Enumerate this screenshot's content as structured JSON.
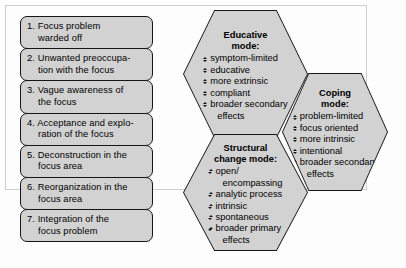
{
  "diagram": {
    "stages": {
      "title": "Stages of focus processing",
      "items": [
        {
          "num": "1.",
          "line1": "Focus problem",
          "line2": "warded off"
        },
        {
          "num": "2.",
          "line1": "Unwanted preoccupa-",
          "line2": "tion with the focus"
        },
        {
          "num": "3.",
          "line1": "Vague awareness of",
          "line2": "the focus"
        },
        {
          "num": "4.",
          "line1": "Acceptance and explo-",
          "line2": "ration of the focus"
        },
        {
          "num": "5.",
          "line1": "Deconstruction in the",
          "line2": "focus area"
        },
        {
          "num": "6.",
          "line1": "Reorganization in the",
          "line2": "focus area"
        },
        {
          "num": "7.",
          "line1": "Integration of the",
          "line2": "focus problem"
        }
      ]
    },
    "modes": [
      {
        "id": "educative",
        "title": "Educative\nmode:",
        "items": [
          {
            "text": "symptom-limited",
            "cont": ""
          },
          {
            "text": "educative",
            "cont": ""
          },
          {
            "text": "more extrinsic",
            "cont": ""
          },
          {
            "text": "compliant",
            "cont": ""
          },
          {
            "text": "broader secondary",
            "cont": "effects"
          }
        ]
      },
      {
        "id": "coping",
        "title": "Coping\nmode:",
        "items": [
          {
            "text": "problem-limited",
            "cont": ""
          },
          {
            "text": "focus oriented",
            "cont": ""
          },
          {
            "text": "more intrinsic",
            "cont": ""
          },
          {
            "text": "intentional",
            "cont": ""
          },
          {
            "text": "broader secondary",
            "cont": "effects"
          }
        ]
      },
      {
        "id": "structural",
        "title": "Structural\nchange mode:",
        "items": [
          {
            "text": "open/",
            "cont": "encompassing"
          },
          {
            "text": "analytic process",
            "cont": ""
          },
          {
            "text": "intrinsic",
            "cont": ""
          },
          {
            "text": "spontaneous",
            "cont": ""
          },
          {
            "text": "broader primary",
            "cont": "effects"
          }
        ]
      }
    ],
    "colors": {
      "shape_fill": "#d2d2d2",
      "shape_border": "#161616",
      "frame_border": "#cfcfcf",
      "background": "#fdfdfd",
      "text": "#000000"
    }
  }
}
